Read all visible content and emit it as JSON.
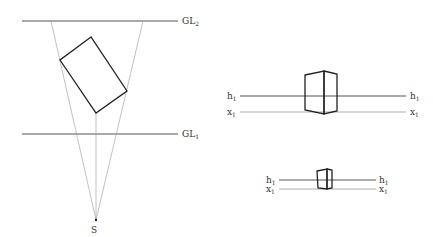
{
  "colors": {
    "line": "#555555",
    "thin_line": "#999999",
    "shape": "#222222",
    "text": "#333333"
  },
  "plan_view": {
    "ground_line_2": {
      "label": "GL",
      "subscript": "2"
    },
    "ground_line_1": {
      "label": "GL",
      "subscript": "1"
    },
    "station_point": {
      "label": "S"
    }
  },
  "view_1": {
    "horizon_left": {
      "label": "h",
      "subscript": "1"
    },
    "horizon_right": {
      "label": "h",
      "subscript": "1"
    },
    "ground_left": {
      "label": "x",
      "subscript": "1"
    },
    "ground_right": {
      "label": "x",
      "subscript": "1"
    }
  },
  "view_2": {
    "horizon_left": {
      "label": "h",
      "subscript": "1"
    },
    "horizon_right": {
      "label": "h",
      "subscript": "1"
    },
    "ground_left": {
      "label": "x",
      "subscript": "1"
    },
    "ground_right": {
      "label": "x",
      "subscript": "1"
    }
  }
}
